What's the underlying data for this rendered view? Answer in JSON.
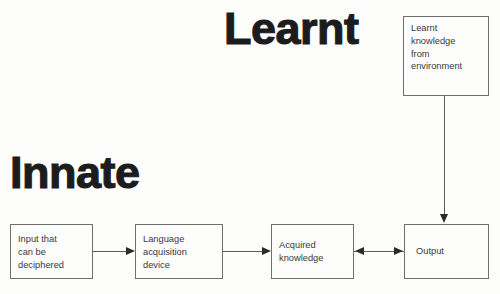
{
  "diagram": {
    "type": "flowchart",
    "background_color": "#fdfdfc",
    "box_border_color": "#6f6f6f",
    "text_color": "#3a3a3a",
    "heading_color": "#1c1c1c",
    "arrow_color": "#2b2b2b",
    "headings": [
      {
        "id": "learnt",
        "label": "Learnt"
      },
      {
        "id": "innate",
        "label": "Innate"
      }
    ],
    "nodes": [
      {
        "id": "learnt-knowledge",
        "label": "Learnt\nknowledge\nfrom\nenvironment"
      },
      {
        "id": "input",
        "label": "Input that\ncan be\ndeciphered"
      },
      {
        "id": "lad",
        "label": "Language\nacquisition\ndevice"
      },
      {
        "id": "acquired",
        "label": "Acquired\nknowledge"
      },
      {
        "id": "output",
        "label": "Output"
      }
    ],
    "edges": [
      {
        "id": "input-to-lad",
        "from": "input",
        "to": "lad",
        "direction": "right"
      },
      {
        "id": "lad-to-acquired",
        "from": "lad",
        "to": "acquired",
        "direction": "right"
      },
      {
        "id": "acquired-output",
        "from": "acquired",
        "to": "output",
        "direction": "bidirectional"
      },
      {
        "id": "learnt-knowledge-to-output",
        "from": "learnt-knowledge",
        "to": "output",
        "direction": "down"
      }
    ]
  }
}
